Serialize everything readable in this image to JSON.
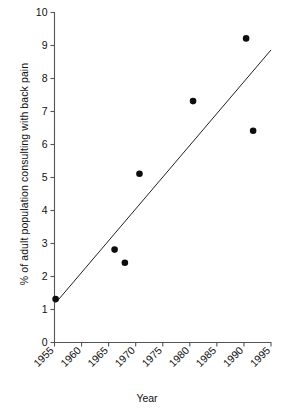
{
  "chart_data": {
    "type": "scatter",
    "title": "",
    "xlabel": "Year",
    "ylabel": "% of adult population consulting with back pain",
    "xlim": [
      1955,
      1995
    ],
    "ylim": [
      0,
      10
    ],
    "grid": false,
    "legend": null,
    "x_ticks": [
      "1955",
      "1960",
      "1965",
      "1970",
      "1975",
      "1980",
      "1985",
      "1990",
      "1995"
    ],
    "x_tick_values": [
      1955,
      1960,
      1965,
      1970,
      1975,
      1980,
      1985,
      1990,
      1995
    ],
    "x_tick_rotation": -45,
    "y_ticks": [
      "0",
      "1",
      "2",
      "3",
      "4",
      "5",
      "6",
      "7",
      "8",
      "9",
      "10"
    ],
    "y_tick_values": [
      0,
      1,
      2,
      3,
      4,
      5,
      6,
      7,
      8,
      9,
      10
    ],
    "series": [
      {
        "name": "Back pain consultations",
        "marker": "filled-circle",
        "color": "#0d0d0d",
        "points": [
          {
            "x": 1955.2,
            "y": 1.3
          },
          {
            "x": 1966.1,
            "y": 2.8
          },
          {
            "x": 1968.0,
            "y": 2.4
          },
          {
            "x": 1970.7,
            "y": 5.1
          },
          {
            "x": 1980.6,
            "y": 7.3
          },
          {
            "x": 1990.4,
            "y": 9.2
          },
          {
            "x": 1991.7,
            "y": 6.4
          }
        ]
      },
      {
        "name": "Fitted trend line",
        "marker": "line",
        "color": "#222222",
        "points": [
          {
            "x": 1955.3,
            "y": 1.2
          },
          {
            "x": 1995.0,
            "y": 8.85
          }
        ]
      }
    ]
  },
  "axes": {
    "y_title": "% of adult population consulting with back pain",
    "x_title": "Year"
  }
}
